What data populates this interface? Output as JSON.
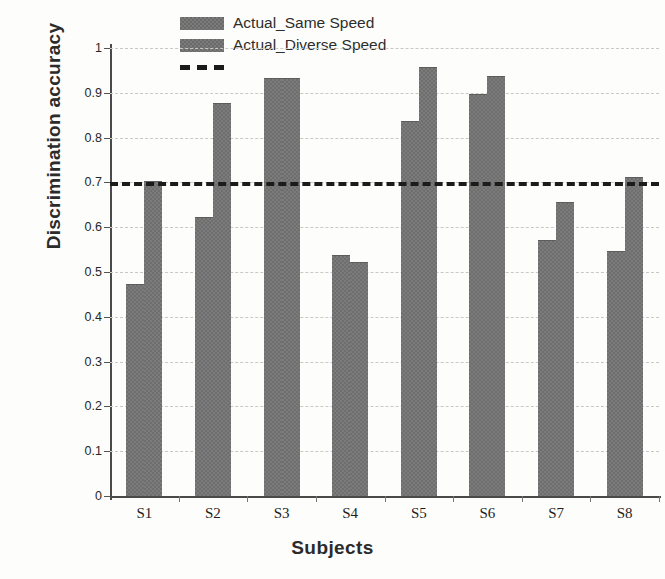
{
  "chart_data": {
    "type": "bar",
    "title": "",
    "xlabel": "Subjects",
    "ylabel": "Discrimination accuracy",
    "categories": [
      "S1",
      "S2",
      "S3",
      "S4",
      "S5",
      "S6",
      "S7",
      "S8"
    ],
    "series": [
      {
        "name": "Actual_Same Speed",
        "values": [
          0.47,
          0.62,
          0.93,
          0.535,
          0.835,
          0.895,
          0.57,
          0.545
        ]
      },
      {
        "name": "Actual_Diverse Speed",
        "values": [
          0.7,
          0.875,
          0.93,
          0.52,
          0.955,
          0.935,
          0.655,
          0.71
        ]
      }
    ],
    "threshold_line": {
      "value": 0.7,
      "style": "dashed",
      "color": "#1b1b1b",
      "label": ""
    },
    "ylim": [
      0,
      1
    ],
    "yticks": [
      "0",
      "0.1",
      "0.2",
      "0.3",
      "0.4",
      "0.5",
      "0.6",
      "0.7",
      "0.8",
      "0.9",
      "1"
    ],
    "ytick_values": [
      0,
      0.1,
      0.2,
      0.3,
      0.4,
      0.5,
      0.6,
      0.7,
      0.8,
      0.9,
      1
    ],
    "grid": true,
    "grid_axis": "y",
    "legend_position": "top-center",
    "legend": [
      {
        "label": "Actual_Same Speed",
        "marker": "bar-swatch"
      },
      {
        "label": "Actual_Diverse Speed",
        "marker": "bar-swatch"
      },
      {
        "label": "",
        "marker": "dashed-line"
      }
    ],
    "colors": {
      "bar_fill": "#7b7b7b",
      "threshold": "#1b1b1b",
      "grid": "#c9c9c2",
      "axis": "#4a4a4a",
      "background": "#fdfdfb"
    }
  }
}
